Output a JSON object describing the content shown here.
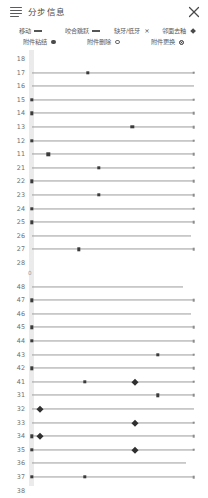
{
  "header": {
    "title": "分步信息",
    "menu_icon": "hamburger-icon",
    "close_icon": "close-icon"
  },
  "legend": {
    "rows": [
      [
        {
          "label": "移动",
          "symbol": "dash",
          "symbol_name": "line-dash-symbol"
        },
        {
          "label": "咬合跳跃",
          "symbol": "dash",
          "symbol_name": "line-dash-symbol"
        },
        {
          "label": "缺牙/低牙",
          "symbol": "x",
          "symbol_name": "cross-symbol",
          "glyph": "×"
        },
        {
          "label": "邻面去釉",
          "symbol": "diamond",
          "symbol_name": "diamond-symbol"
        }
      ],
      [
        {
          "label": "附件粘结",
          "symbol": "dot",
          "symbol_name": "filled-circle-symbol"
        },
        {
          "label": "附件删除",
          "symbol": "ring",
          "symbol_name": "hollow-circle-symbol"
        },
        {
          "label": "附件更换",
          "symbol": "target",
          "symbol_name": "ringed-dot-symbol"
        }
      ]
    ]
  },
  "chart_data": {
    "type": "table",
    "title": "分步信息",
    "xlabel": "",
    "ylabel": "牙位",
    "axis_origin_label": "0",
    "xlim": [
      0,
      60
    ],
    "grid": false,
    "legend_position": "top",
    "colors": {
      "line": "#9c9c9c",
      "marker": "#3b3b3b",
      "end_marker": "#8d8d8d",
      "diamond": "#2f2f2f",
      "band": "#ebebeb",
      "text": "#6f6f6f"
    },
    "groups": [
      {
        "name": "upper",
        "rows": [
          {
            "tooth": "18",
            "line_start": 0,
            "line_end": 0,
            "markers": []
          },
          {
            "tooth": "17",
            "line_start": 0,
            "line_end": 58,
            "markers": [
              {
                "x": 20,
                "type": "square"
              },
              {
                "x": 58,
                "type": "end-square"
              }
            ]
          },
          {
            "tooth": "16",
            "line_start": 0,
            "line_end": 58,
            "markers": []
          },
          {
            "tooth": "15",
            "line_start": 0,
            "line_end": 58,
            "markers": [
              {
                "x": 0,
                "type": "square"
              },
              {
                "x": 58,
                "type": "end-square"
              }
            ]
          },
          {
            "tooth": "14",
            "line_start": 0,
            "line_end": 58,
            "markers": [
              {
                "x": 0,
                "type": "square"
              },
              {
                "x": 58,
                "type": "end-square"
              }
            ]
          },
          {
            "tooth": "13",
            "line_start": 0,
            "line_end": 58,
            "markers": [
              {
                "x": 36,
                "type": "square"
              },
              {
                "x": 58,
                "type": "end-square"
              }
            ]
          },
          {
            "tooth": "12",
            "line_start": 0,
            "line_end": 58,
            "markers": [
              {
                "x": 0,
                "type": "square"
              },
              {
                "x": 58,
                "type": "end-square"
              }
            ]
          },
          {
            "tooth": "11",
            "line_start": 0,
            "line_end": 58,
            "markers": [
              {
                "x": 6,
                "type": "square"
              },
              {
                "x": 58,
                "type": "end-square"
              }
            ]
          },
          {
            "tooth": "21",
            "line_start": 0,
            "line_end": 58,
            "markers": [
              {
                "x": 24,
                "type": "square"
              },
              {
                "x": 58,
                "type": "end-square"
              }
            ]
          },
          {
            "tooth": "22",
            "line_start": 0,
            "line_end": 58,
            "markers": [
              {
                "x": 0,
                "type": "square"
              },
              {
                "x": 58,
                "type": "end-square"
              }
            ]
          },
          {
            "tooth": "23",
            "line_start": 0,
            "line_end": 58,
            "markers": [
              {
                "x": 24,
                "type": "square"
              },
              {
                "x": 58,
                "type": "end-square"
              }
            ]
          },
          {
            "tooth": "24",
            "line_start": 0,
            "line_end": 58,
            "markers": [
              {
                "x": 0,
                "type": "square"
              },
              {
                "x": 58,
                "type": "end-square"
              }
            ]
          },
          {
            "tooth": "25",
            "line_start": 0,
            "line_end": 58,
            "markers": [
              {
                "x": 0,
                "type": "square"
              },
              {
                "x": 58,
                "type": "end-square"
              }
            ]
          },
          {
            "tooth": "26",
            "line_start": 0,
            "line_end": 57,
            "markers": []
          },
          {
            "tooth": "27",
            "line_start": 0,
            "line_end": 58,
            "markers": [
              {
                "x": 17,
                "type": "square"
              },
              {
                "x": 58,
                "type": "end-square"
              }
            ]
          },
          {
            "tooth": "28",
            "line_start": 0,
            "line_end": 0,
            "markers": []
          }
        ]
      },
      {
        "name": "lower",
        "rows": [
          {
            "tooth": "48",
            "line_start": 0,
            "line_end": 54,
            "markers": []
          },
          {
            "tooth": "47",
            "line_start": 0,
            "line_end": 58,
            "markers": [
              {
                "x": 0,
                "type": "square"
              },
              {
                "x": 58,
                "type": "end-square"
              }
            ]
          },
          {
            "tooth": "46",
            "line_start": 0,
            "line_end": 57,
            "markers": []
          },
          {
            "tooth": "45",
            "line_start": 0,
            "line_end": 58,
            "markers": [
              {
                "x": 0,
                "type": "square"
              },
              {
                "x": 58,
                "type": "end-square"
              }
            ]
          },
          {
            "tooth": "44",
            "line_start": 0,
            "line_end": 58,
            "markers": [
              {
                "x": 0,
                "type": "square"
              },
              {
                "x": 58,
                "type": "end-square"
              }
            ]
          },
          {
            "tooth": "43",
            "line_start": 0,
            "line_end": 58,
            "markers": [
              {
                "x": 45,
                "type": "square"
              },
              {
                "x": 58,
                "type": "end-square"
              }
            ]
          },
          {
            "tooth": "42",
            "line_start": 0,
            "line_end": 58,
            "markers": [
              {
                "x": 0,
                "type": "square"
              },
              {
                "x": 58,
                "type": "end-square"
              }
            ]
          },
          {
            "tooth": "41",
            "line_start": 0,
            "line_end": 58,
            "markers": [
              {
                "x": 19,
                "type": "square"
              },
              {
                "x": 58,
                "type": "end-square"
              },
              {
                "x": 37,
                "type": "diamond"
              }
            ]
          },
          {
            "tooth": "31",
            "line_start": 0,
            "line_end": 58,
            "markers": [
              {
                "x": 45,
                "type": "square"
              },
              {
                "x": 58,
                "type": "end-square"
              }
            ]
          },
          {
            "tooth": "32",
            "line_start": 0,
            "line_end": 58,
            "markers": [
              {
                "x": 3,
                "type": "diamond"
              }
            ]
          },
          {
            "tooth": "33",
            "line_start": 0,
            "line_end": 58,
            "markers": [
              {
                "x": 58,
                "type": "end-square"
              },
              {
                "x": 37,
                "type": "diamond"
              }
            ]
          },
          {
            "tooth": "34",
            "line_start": 0,
            "line_end": 58,
            "markers": [
              {
                "x": 0,
                "type": "square"
              },
              {
                "x": 58,
                "type": "end-square"
              },
              {
                "x": 3,
                "type": "diamond"
              }
            ]
          },
          {
            "tooth": "35",
            "line_start": 0,
            "line_end": 58,
            "markers": [
              {
                "x": 0,
                "type": "square"
              },
              {
                "x": 58,
                "type": "end-square"
              },
              {
                "x": 37,
                "type": "diamond"
              }
            ]
          },
          {
            "tooth": "36",
            "line_start": 0,
            "line_end": 55,
            "markers": []
          },
          {
            "tooth": "37",
            "line_start": 0,
            "line_end": 58,
            "markers": [
              {
                "x": 0,
                "type": "square"
              },
              {
                "x": 58,
                "type": "end-square"
              },
              {
                "x": 19,
                "type": "square"
              }
            ]
          },
          {
            "tooth": "38",
            "line_start": 0,
            "line_end": 0,
            "markers": []
          }
        ]
      }
    ]
  }
}
